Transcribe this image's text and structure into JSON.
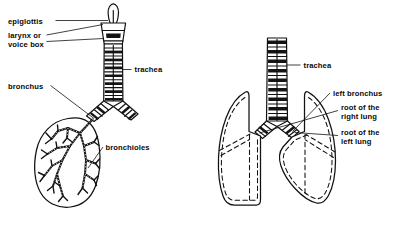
{
  "figure": {
    "background_color": "#ffffff",
    "ink_color": "#111111",
    "width": 409,
    "height": 241
  },
  "panels": [
    {
      "id": "left-panel",
      "name": "airway-and-bronchial-tree",
      "description": "Epiglottis, larynx, trachea branching into bronchi and a bronchiole tree inside a single lung outline"
    },
    {
      "id": "right-panel",
      "name": "lungs-and-roots",
      "description": "Trachea dividing into left and right bronchi entering the roots of both lungs"
    }
  ],
  "labels": {
    "epiglottis": "epiglottis",
    "larynx_line1": "larynx or",
    "larynx_line2": "voice box",
    "bronchus": "bronchus",
    "trachea_left": "trachea",
    "bronchioles": "bronchioles",
    "trachea_right": "trachea",
    "left_bronchus": "left bronchus",
    "root_right_line1": "root of the",
    "root_right_line2": "right lung",
    "root_left_line1": "root of the",
    "root_left_line2": "left lung"
  }
}
